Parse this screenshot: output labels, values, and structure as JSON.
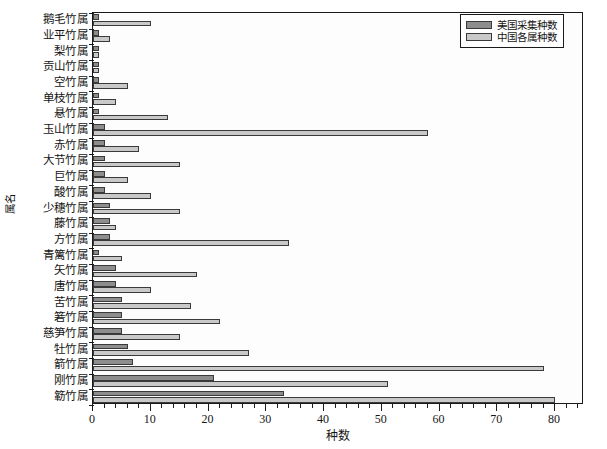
{
  "chart_data": {
    "type": "bar",
    "orientation": "horizontal",
    "title": "",
    "xlabel": "种数",
    "ylabel": "属名",
    "xlim": [
      0,
      85
    ],
    "ylim_categories": 26,
    "grid": false,
    "legend_position": "top-right",
    "xticks": [
      0,
      10,
      20,
      30,
      40,
      50,
      60,
      70,
      80
    ],
    "xticklabels": [
      "0",
      "10",
      "20",
      "30",
      "40",
      "50",
      "60",
      "70",
      "80"
    ],
    "minor_tick_interval": 2,
    "categories": [
      "鹅毛竹属",
      "业平竹属",
      "梨竹属",
      "贡山竹属",
      "空竹属",
      "单枝竹属",
      "悬竹属",
      "玉山竹属",
      "赤竹属",
      "大节竹属",
      "巨竹属",
      "酸竹属",
      "少穗竹属",
      "藤竹属",
      "方竹属",
      "青篱竹属",
      "矢竹属",
      "唐竹属",
      "苦竹属",
      "箬竹属",
      "慈笋竹属",
      "牡竹属",
      "箭竹属",
      "刚竹属",
      "簕竹属"
    ],
    "series": [
      {
        "name": "美国采集种数",
        "color": "#8d8d8d",
        "values": [
          1,
          1,
          1,
          1,
          1,
          1,
          1,
          2,
          2,
          2,
          2,
          2,
          3,
          3,
          3,
          1,
          4,
          4,
          5,
          5,
          5,
          6,
          7,
          21,
          33
        ]
      },
      {
        "name": "中国各属种数",
        "color": "#c9c9c9",
        "values": [
          10,
          3,
          1,
          1,
          6,
          4,
          13,
          58,
          8,
          15,
          6,
          10,
          15,
          4,
          34,
          5,
          18,
          10,
          17,
          22,
          15,
          27,
          78,
          51,
          80
        ]
      }
    ]
  },
  "legend": {
    "entries": [
      {
        "label": "美国采集种数",
        "color": "#8d8d8d"
      },
      {
        "label": "中国各属种数",
        "color": "#c9c9c9"
      }
    ]
  },
  "axes": {
    "x_title": "种数",
    "y_title": "属名"
  }
}
